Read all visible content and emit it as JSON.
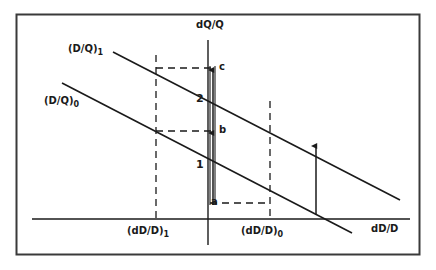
{
  "figure": {
    "type": "economics-line-diagram",
    "background_color": "#ffffff",
    "ink_color": "#1a1a1a",
    "frame": {
      "x": 16,
      "y": 14,
      "width": 404,
      "height": 241
    }
  },
  "axes": {
    "y_axis_label": "dQ/Q",
    "x_axis_label": "dD/D",
    "y_axis_x": 208,
    "x_axis_y": 219
  },
  "curves": [
    {
      "id": "upper",
      "label_main": "(D/Q)",
      "label_sub": "1",
      "label_x": 68,
      "label_y": 44,
      "x1": 113,
      "y1": 52,
      "x2": 400,
      "y2": 200
    },
    {
      "id": "lower",
      "label_main": "(D/Q)",
      "label_sub": "0",
      "label_x": 44,
      "label_y": 96,
      "x1": 62,
      "y1": 83,
      "x2": 352,
      "y2": 233
    }
  ],
  "x_ticks": [
    {
      "label_main": "(dD/D)",
      "label_sub": "1",
      "x": 156,
      "label_x": 127,
      "label_y": 226
    },
    {
      "label_main": "(dD/D)",
      "label_sub": "0",
      "x": 270,
      "label_x": 241,
      "label_y": 226
    }
  ],
  "points": [
    {
      "name": "c",
      "x": 213,
      "y": 68,
      "label_x": 216,
      "label_y": 63
    },
    {
      "name": "b",
      "x": 213,
      "y": 131,
      "label_x": 216,
      "label_y": 126
    },
    {
      "name": "a",
      "x": 213,
      "y": 203,
      "label_x": 211,
      "label_y": 198
    }
  ],
  "segments": [
    {
      "name": "2",
      "label_x": 196,
      "label_y": 98,
      "from_y": 68,
      "to_y": 131
    },
    {
      "name": "1",
      "label_x": 196,
      "label_y": 164,
      "from_y": 131,
      "to_y": 203
    }
  ],
  "arrows": [
    {
      "id": "segment-arrow-c",
      "x": 213,
      "y_from": 133,
      "y_to": 68
    },
    {
      "id": "segment-arrow-b",
      "x": 213,
      "y_from": 205,
      "y_to": 131
    },
    {
      "id": "shift-arrow-right",
      "x": 316,
      "y_from": 215,
      "y_to": 144
    }
  ],
  "dashed_lines": [
    {
      "id": "vertical-at-dD-D-1",
      "x1": 156,
      "y1": 55,
      "x2": 156,
      "y2": 219
    },
    {
      "id": "vertical-at-dD-D-0",
      "x1": 270,
      "y1": 101,
      "x2": 270,
      "y2": 219
    },
    {
      "id": "horizontal-to-c",
      "x1": 156,
      "y1": 68,
      "x2": 212,
      "y2": 68
    },
    {
      "id": "horizontal-to-b",
      "x1": 156,
      "y1": 131,
      "x2": 212,
      "y2": 131
    },
    {
      "id": "horizontal-to-a",
      "x1": 210,
      "y1": 203,
      "x2": 270,
      "y2": 203
    }
  ]
}
